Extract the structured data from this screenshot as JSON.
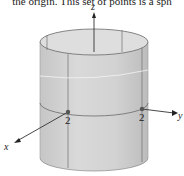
{
  "caption": "the origin. This set of points is a sph",
  "diagram": {
    "type": "cylinder",
    "axes": {
      "x": "x",
      "y": "y",
      "z": "z"
    },
    "intercepts": {
      "x_point": "2",
      "y_point": "2"
    },
    "colors": {
      "surface": "#d4d4d4",
      "surface_dark": "#bdbdbd",
      "top_inner": "#e0e0e0",
      "edge": "#6a6a6a",
      "axis": "#333333",
      "point": "#555555"
    }
  }
}
